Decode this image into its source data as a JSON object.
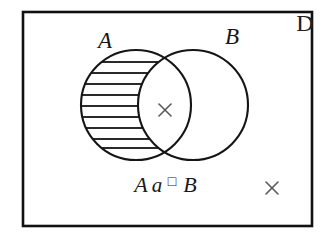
{
  "figure": {
    "universe_label": "D",
    "set_a_label": "A",
    "set_b_label": "B",
    "expression_label": "Aa□B",
    "expression_parts": {
      "part1": "A",
      "part2": "a",
      "part3": "□",
      "part4": "B"
    },
    "marks": {
      "intersection_mark": "×",
      "outside_mark": "×"
    },
    "colors": {
      "stroke": "#151515",
      "hatch": "#2a2a2a",
      "mark": "#5a5a5a",
      "background": "#ffffff",
      "border": "#111111"
    },
    "geometry": {
      "border_x": 23,
      "border_y": 12,
      "border_width": 289,
      "border_height": 214,
      "circle_a_cx": 136,
      "circle_a_cy": 105,
      "circle_b_cx": 193,
      "circle_b_cy": 105,
      "circle_r": 55,
      "hatch_line_count": 9
    }
  }
}
